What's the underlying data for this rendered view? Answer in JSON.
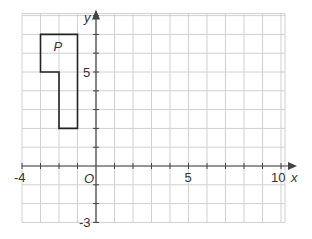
{
  "diagram": {
    "type": "coordinate-grid",
    "origin_label": "O",
    "x_axis": {
      "label": "x",
      "min": -4,
      "max": 10,
      "tick_labels": [
        "-4",
        "5",
        "10"
      ]
    },
    "y_axis": {
      "label": "y",
      "min": -3,
      "max": 8,
      "tick_labels": [
        "5",
        "-3"
      ]
    },
    "shape": {
      "label": "P",
      "vertices": [
        [
          -3,
          7
        ],
        [
          -1,
          7
        ],
        [
          -1,
          2
        ],
        [
          -2,
          2
        ],
        [
          -2,
          5
        ],
        [
          -3,
          5
        ]
      ]
    },
    "colors": {
      "grid": "#d0d0d0",
      "axis": "#444444",
      "shape": "#222222"
    }
  }
}
